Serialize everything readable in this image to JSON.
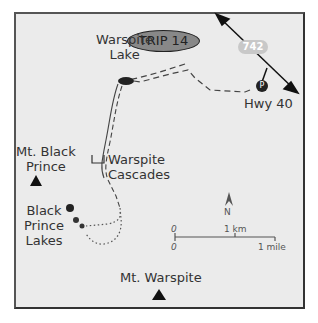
{
  "title": "TRIP 14",
  "labels": {
    "warspite_lake": [
      "Warspite",
      "Lake"
    ],
    "mt_black_prince": [
      "Mt. Black",
      "Prince"
    ],
    "warspite_cascades": [
      "Warspite",
      "Cascades"
    ],
    "black_prince_lakes": [
      "Black",
      "Prince",
      "Lakes"
    ],
    "mt_warspite": "Mt. Warspite",
    "hwy_40": "Hwy 40",
    "road_742": "742",
    "parking": "P"
  },
  "compass": {
    "north": "N"
  },
  "scale": {
    "zero_top": "0",
    "zero_bottom": "0",
    "km": "1 km",
    "mile": "1 mile"
  },
  "colors": {
    "background": "#ebebeb",
    "border": "#444444",
    "oval": "#888888",
    "road_badge": "#c8c8c8",
    "ink": "#222222"
  }
}
